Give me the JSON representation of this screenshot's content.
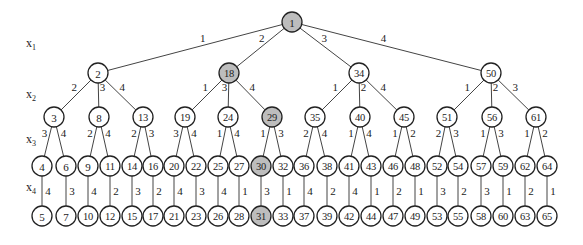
{
  "diagram": {
    "type": "state-space-tree",
    "levels": [
      {
        "label": "x",
        "sub": "1",
        "x": 26,
        "y": 47
      },
      {
        "label": "x",
        "sub": "2",
        "x": 26,
        "y": 98
      },
      {
        "label": "x",
        "sub": "3",
        "x": 26,
        "y": 143
      },
      {
        "label": "x",
        "sub": "4",
        "x": 26,
        "y": 191
      }
    ],
    "highlight_color": "#bdbdbd",
    "nodes": [
      {
        "id": "1",
        "label": "1",
        "x": 292,
        "y": 22,
        "hl": true
      },
      {
        "id": "2",
        "label": "2",
        "x": 98,
        "y": 73
      },
      {
        "id": "18",
        "label": "18",
        "x": 229,
        "y": 73,
        "hl": true
      },
      {
        "id": "34",
        "label": "34",
        "x": 359,
        "y": 73
      },
      {
        "id": "50",
        "label": "50",
        "x": 491,
        "y": 73
      },
      {
        "id": "3",
        "label": "3",
        "x": 54,
        "y": 117
      },
      {
        "id": "8",
        "label": "8",
        "x": 99,
        "y": 117
      },
      {
        "id": "13",
        "label": "13",
        "x": 143,
        "y": 117
      },
      {
        "id": "19",
        "label": "19",
        "x": 185,
        "y": 117
      },
      {
        "id": "24",
        "label": "24",
        "x": 228,
        "y": 117
      },
      {
        "id": "29",
        "label": "29",
        "x": 272,
        "y": 117,
        "hl": true
      },
      {
        "id": "35",
        "label": "35",
        "x": 315,
        "y": 117
      },
      {
        "id": "40",
        "label": "40",
        "x": 360,
        "y": 117
      },
      {
        "id": "45",
        "label": "45",
        "x": 404,
        "y": 117
      },
      {
        "id": "51",
        "label": "51",
        "x": 447,
        "y": 117
      },
      {
        "id": "56",
        "label": "56",
        "x": 492,
        "y": 117
      },
      {
        "id": "61",
        "label": "61",
        "x": 536,
        "y": 117
      },
      {
        "id": "4",
        "label": "4",
        "x": 42,
        "y": 166
      },
      {
        "id": "6",
        "label": "6",
        "x": 66,
        "y": 166
      },
      {
        "id": "9",
        "label": "9",
        "x": 88,
        "y": 166
      },
      {
        "id": "11",
        "label": "11",
        "x": 110,
        "y": 166
      },
      {
        "id": "14",
        "label": "14",
        "x": 132,
        "y": 166
      },
      {
        "id": "16",
        "label": "16",
        "x": 153,
        "y": 166
      },
      {
        "id": "20",
        "label": "20",
        "x": 174,
        "y": 166
      },
      {
        "id": "22",
        "label": "22",
        "x": 196,
        "y": 166
      },
      {
        "id": "25",
        "label": "25",
        "x": 218,
        "y": 166
      },
      {
        "id": "27",
        "label": "27",
        "x": 239,
        "y": 166
      },
      {
        "id": "30",
        "label": "30",
        "x": 261,
        "y": 166,
        "hl": true
      },
      {
        "id": "32",
        "label": "32",
        "x": 283,
        "y": 166
      },
      {
        "id": "36",
        "label": "36",
        "x": 304,
        "y": 166
      },
      {
        "id": "38",
        "label": "38",
        "x": 327,
        "y": 166
      },
      {
        "id": "41",
        "label": "41",
        "x": 349,
        "y": 166
      },
      {
        "id": "43",
        "label": "43",
        "x": 371,
        "y": 166
      },
      {
        "id": "46",
        "label": "46",
        "x": 393,
        "y": 166
      },
      {
        "id": "48",
        "label": "48",
        "x": 415,
        "y": 166
      },
      {
        "id": "52",
        "label": "52",
        "x": 437,
        "y": 166
      },
      {
        "id": "54",
        "label": "54",
        "x": 458,
        "y": 166
      },
      {
        "id": "57",
        "label": "57",
        "x": 481,
        "y": 166
      },
      {
        "id": "59",
        "label": "59",
        "x": 503,
        "y": 166
      },
      {
        "id": "62",
        "label": "62",
        "x": 525,
        "y": 166
      },
      {
        "id": "64",
        "label": "64",
        "x": 547,
        "y": 166
      },
      {
        "id": "5",
        "label": "5",
        "x": 42,
        "y": 216
      },
      {
        "id": "7",
        "label": "7",
        "x": 66,
        "y": 216
      },
      {
        "id": "10",
        "label": "10",
        "x": 88,
        "y": 216
      },
      {
        "id": "12",
        "label": "12",
        "x": 110,
        "y": 216
      },
      {
        "id": "15",
        "label": "15",
        "x": 132,
        "y": 216
      },
      {
        "id": "17",
        "label": "17",
        "x": 153,
        "y": 216
      },
      {
        "id": "21",
        "label": "21",
        "x": 174,
        "y": 216
      },
      {
        "id": "23",
        "label": "23",
        "x": 196,
        "y": 216
      },
      {
        "id": "26",
        "label": "26",
        "x": 218,
        "y": 216
      },
      {
        "id": "28",
        "label": "28",
        "x": 239,
        "y": 216
      },
      {
        "id": "31",
        "label": "31",
        "x": 261,
        "y": 216,
        "hl": true
      },
      {
        "id": "33",
        "label": "33",
        "x": 283,
        "y": 216
      },
      {
        "id": "37",
        "label": "37",
        "x": 304,
        "y": 216
      },
      {
        "id": "39",
        "label": "39",
        "x": 327,
        "y": 216
      },
      {
        "id": "42",
        "label": "42",
        "x": 349,
        "y": 216
      },
      {
        "id": "44",
        "label": "44",
        "x": 371,
        "y": 216
      },
      {
        "id": "47",
        "label": "47",
        "x": 393,
        "y": 216
      },
      {
        "id": "49",
        "label": "49",
        "x": 415,
        "y": 216
      },
      {
        "id": "53",
        "label": "53",
        "x": 437,
        "y": 216
      },
      {
        "id": "55",
        "label": "55",
        "x": 458,
        "y": 216
      },
      {
        "id": "58",
        "label": "58",
        "x": 481,
        "y": 216
      },
      {
        "id": "60",
        "label": "60",
        "x": 503,
        "y": 216
      },
      {
        "id": "63",
        "label": "63",
        "x": 525,
        "y": 216
      },
      {
        "id": "65",
        "label": "65",
        "x": 547,
        "y": 216
      }
    ],
    "edges": [
      {
        "from": "1",
        "to": "2",
        "label": "1"
      },
      {
        "from": "1",
        "to": "18",
        "label": "2"
      },
      {
        "from": "1",
        "to": "34",
        "label": "3"
      },
      {
        "from": "1",
        "to": "50",
        "label": "4"
      },
      {
        "from": "2",
        "to": "3",
        "label": "2"
      },
      {
        "from": "2",
        "to": "8",
        "label": "3"
      },
      {
        "from": "2",
        "to": "13",
        "label": "4"
      },
      {
        "from": "18",
        "to": "19",
        "label": "1"
      },
      {
        "from": "18",
        "to": "24",
        "label": "3"
      },
      {
        "from": "18",
        "to": "29",
        "label": "4"
      },
      {
        "from": "34",
        "to": "35",
        "label": "1"
      },
      {
        "from": "34",
        "to": "40",
        "label": "2"
      },
      {
        "from": "34",
        "to": "45",
        "label": "4"
      },
      {
        "from": "50",
        "to": "51",
        "label": "1"
      },
      {
        "from": "50",
        "to": "56",
        "label": "2"
      },
      {
        "from": "50",
        "to": "61",
        "label": "3"
      },
      {
        "from": "3",
        "to": "4",
        "label": "3"
      },
      {
        "from": "3",
        "to": "6",
        "label": "4"
      },
      {
        "from": "8",
        "to": "9",
        "label": "2"
      },
      {
        "from": "8",
        "to": "11",
        "label": "4"
      },
      {
        "from": "13",
        "to": "14",
        "label": "2"
      },
      {
        "from": "13",
        "to": "16",
        "label": "3"
      },
      {
        "from": "19",
        "to": "20",
        "label": "3"
      },
      {
        "from": "19",
        "to": "22",
        "label": "4"
      },
      {
        "from": "24",
        "to": "25",
        "label": "1"
      },
      {
        "from": "24",
        "to": "27",
        "label": "4"
      },
      {
        "from": "29",
        "to": "30",
        "label": "1"
      },
      {
        "from": "29",
        "to": "32",
        "label": "3"
      },
      {
        "from": "35",
        "to": "36",
        "label": "2"
      },
      {
        "from": "35",
        "to": "38",
        "label": "4"
      },
      {
        "from": "40",
        "to": "41",
        "label": "1"
      },
      {
        "from": "40",
        "to": "43",
        "label": "4"
      },
      {
        "from": "45",
        "to": "46",
        "label": "1"
      },
      {
        "from": "45",
        "to": "48",
        "label": "2"
      },
      {
        "from": "51",
        "to": "52",
        "label": "2"
      },
      {
        "from": "51",
        "to": "54",
        "label": "3"
      },
      {
        "from": "56",
        "to": "57",
        "label": "1"
      },
      {
        "from": "56",
        "to": "59",
        "label": "3"
      },
      {
        "from": "61",
        "to": "62",
        "label": "1"
      },
      {
        "from": "61",
        "to": "64",
        "label": "2"
      },
      {
        "from": "4",
        "to": "5",
        "label": "4"
      },
      {
        "from": "6",
        "to": "7",
        "label": "3"
      },
      {
        "from": "9",
        "to": "10",
        "label": "4"
      },
      {
        "from": "11",
        "to": "12",
        "label": "2"
      },
      {
        "from": "14",
        "to": "15",
        "label": "3"
      },
      {
        "from": "16",
        "to": "17",
        "label": "2"
      },
      {
        "from": "20",
        "to": "21",
        "label": "4"
      },
      {
        "from": "22",
        "to": "23",
        "label": "3"
      },
      {
        "from": "25",
        "to": "26",
        "label": "4"
      },
      {
        "from": "27",
        "to": "28",
        "label": "1"
      },
      {
        "from": "30",
        "to": "31",
        "label": "3"
      },
      {
        "from": "32",
        "to": "33",
        "label": "1"
      },
      {
        "from": "36",
        "to": "37",
        "label": "4"
      },
      {
        "from": "38",
        "to": "39",
        "label": "2"
      },
      {
        "from": "41",
        "to": "42",
        "label": "4"
      },
      {
        "from": "43",
        "to": "44",
        "label": "1"
      },
      {
        "from": "46",
        "to": "47",
        "label": "2"
      },
      {
        "from": "48",
        "to": "49",
        "label": "1"
      },
      {
        "from": "52",
        "to": "53",
        "label": "3"
      },
      {
        "from": "54",
        "to": "55",
        "label": "2"
      },
      {
        "from": "57",
        "to": "58",
        "label": "3"
      },
      {
        "from": "59",
        "to": "60",
        "label": "1"
      },
      {
        "from": "62",
        "to": "63",
        "label": "2"
      },
      {
        "from": "64",
        "to": "65",
        "label": "1"
      }
    ]
  }
}
